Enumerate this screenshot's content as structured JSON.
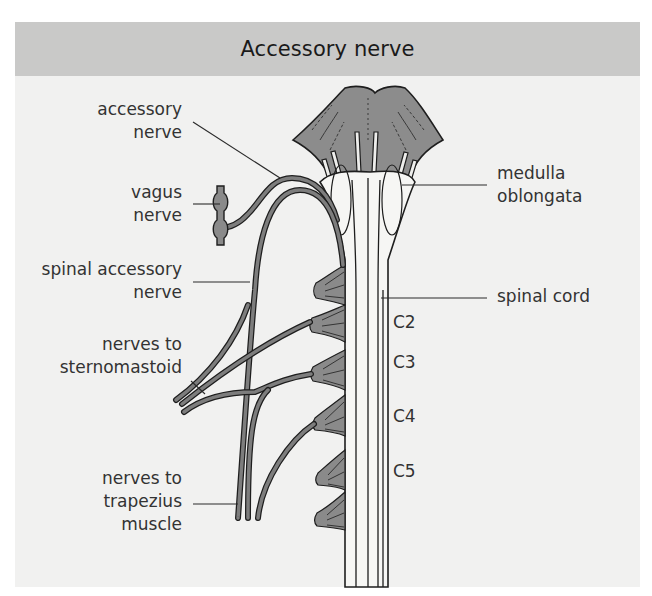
{
  "title": "Accessory nerve",
  "labels_left": [
    {
      "id": "accessory-nerve",
      "lines": [
        "accessory",
        "nerve"
      ]
    },
    {
      "id": "vagus-nerve",
      "lines": [
        "vagus",
        "nerve"
      ]
    },
    {
      "id": "spinal-accessory-nerve",
      "lines": [
        "spinal accessory",
        "nerve"
      ]
    },
    {
      "id": "nerves-to-sternomastoid",
      "lines": [
        "nerves to",
        "sternomastoid"
      ]
    },
    {
      "id": "nerves-to-trapezius",
      "lines": [
        "nerves to",
        "trapezius",
        "muscle"
      ]
    }
  ],
  "labels_right": [
    {
      "id": "medulla-oblongata",
      "lines": [
        "medulla",
        "oblongata"
      ]
    },
    {
      "id": "spinal-cord",
      "lines": [
        "spinal cord"
      ]
    }
  ],
  "segments": [
    "C2",
    "C3",
    "C4",
    "C5"
  ],
  "colors": {
    "header_bg": "#c9c9c8",
    "panel_bg": "#f1f1f0",
    "structure_fill": "#8a8a8a",
    "cord_fill": "#f4f4f2",
    "outline": "#1e1e1e"
  }
}
